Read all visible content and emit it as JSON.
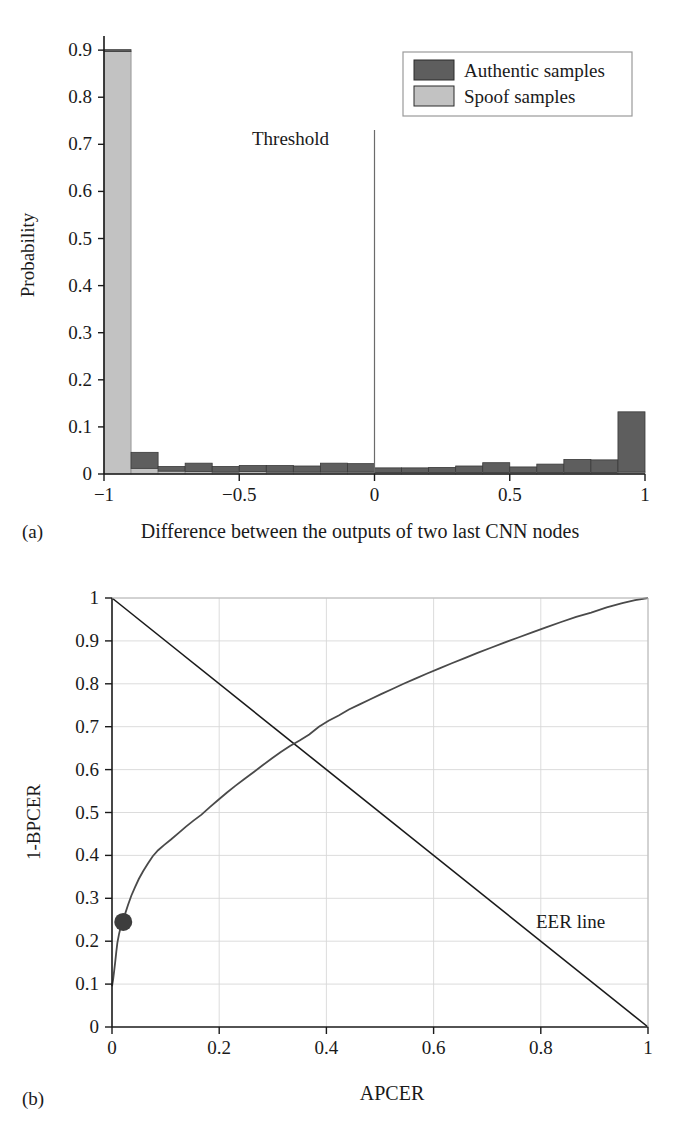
{
  "figure": {
    "panels": [
      {
        "id": "a",
        "subcaption": "(a)",
        "caption": "Difference between the outputs of two last CNN nodes"
      },
      {
        "id": "b",
        "subcaption": "(b)",
        "caption": "APCER"
      }
    ]
  },
  "colors": {
    "authentic": "#5e5e5e",
    "spoof": "#c2c2c2",
    "axis": "#1a1a1a",
    "grid": "#d8d8d8",
    "curve": "#4a4a4a",
    "eer_line": "#1a1a1a",
    "marker": "#3d3d3d",
    "background": "#ffffff"
  },
  "chart_data": [
    {
      "type": "bar",
      "panel": "a",
      "title": "",
      "xlabel": "Difference between the outputs of two last CNN nodes",
      "ylabel": "Probability",
      "xlim": [
        -1,
        1
      ],
      "ylim": [
        0,
        0.93
      ],
      "grid": false,
      "xticks": [
        -1,
        -0.5,
        0,
        0.5,
        1
      ],
      "xtick_labels": [
        "−1",
        "−0.5",
        "0",
        "0.5",
        "1"
      ],
      "yticks": [
        0,
        0.1,
        0.2,
        0.3,
        0.4,
        0.5,
        0.6,
        0.7,
        0.8,
        0.9
      ],
      "ytick_labels": [
        "0",
        "0.1",
        "0.2",
        "0.3",
        "0.4",
        "0.5",
        "0.6",
        "0.7",
        "0.8",
        "0.9"
      ],
      "bin_edges": [
        -1.0,
        -0.9,
        -0.8,
        -0.7,
        -0.6,
        -0.5,
        -0.4,
        -0.3,
        -0.2,
        -0.1,
        0.0,
        0.1,
        0.2,
        0.3,
        0.4,
        0.5,
        0.6,
        0.7,
        0.8,
        0.9,
        1.0
      ],
      "series": [
        {
          "name": "Spoof samples",
          "color": "#c2c2c2",
          "values": [
            0.897,
            0.012,
            0.006,
            0.005,
            0.004,
            0.005,
            0.004,
            0.004,
            0.004,
            0.004,
            0.003,
            0.003,
            0.003,
            0.003,
            0.003,
            0.003,
            0.003,
            0.003,
            0.003,
            0.004
          ]
        },
        {
          "name": "Authentic samples",
          "color": "#5e5e5e",
          "values": [
            0.004,
            0.034,
            0.01,
            0.018,
            0.012,
            0.013,
            0.014,
            0.013,
            0.019,
            0.018,
            0.01,
            0.01,
            0.011,
            0.014,
            0.021,
            0.012,
            0.018,
            0.028,
            0.027,
            0.128
          ]
        }
      ],
      "annotations": [
        {
          "name": "threshold",
          "label": "Threshold",
          "x": 0.0,
          "type": "vline"
        }
      ],
      "legend": {
        "position": "upper right",
        "entries": [
          {
            "label": "Authentic samples",
            "color": "#5e5e5e"
          },
          {
            "label": "Spoof samples",
            "color": "#c2c2c2"
          }
        ]
      }
    },
    {
      "type": "line",
      "panel": "b",
      "title": "",
      "xlabel": "APCER",
      "ylabel": "1-BPCER",
      "xlim": [
        0,
        1
      ],
      "ylim": [
        0,
        1
      ],
      "grid": true,
      "xticks": [
        0,
        0.2,
        0.4,
        0.6,
        0.8,
        1
      ],
      "xtick_labels": [
        "0",
        "0.2",
        "0.4",
        "0.6",
        "0.8",
        "1"
      ],
      "yticks": [
        0,
        0.1,
        0.2,
        0.3,
        0.4,
        0.5,
        0.6,
        0.7,
        0.8,
        0.9,
        1
      ],
      "ytick_labels": [
        "0",
        "0.1",
        "0.2",
        "0.3",
        "0.4",
        "0.5",
        "0.6",
        "0.7",
        "0.8",
        "0.9",
        "1"
      ],
      "series": [
        {
          "name": "ROC curve",
          "color": "#4a4a4a",
          "x": [
            0.0,
            0.002,
            0.004,
            0.006,
            0.008,
            0.01,
            0.013,
            0.016,
            0.02,
            0.024,
            0.03,
            0.036,
            0.043,
            0.05,
            0.058,
            0.067,
            0.076,
            0.086,
            0.097,
            0.11,
            0.124,
            0.138,
            0.152,
            0.167,
            0.182,
            0.198,
            0.214,
            0.23,
            0.247,
            0.264,
            0.281,
            0.298,
            0.315,
            0.332,
            0.35,
            0.368,
            0.386,
            0.404,
            0.423,
            0.442,
            0.462,
            0.482,
            0.502,
            0.523,
            0.544,
            0.566,
            0.588,
            0.611,
            0.634,
            0.658,
            0.682,
            0.707,
            0.732,
            0.758,
            0.784,
            0.811,
            0.838,
            0.866,
            0.894,
            0.923,
            0.952,
            0.976,
            1.0
          ],
          "y": [
            0.095,
            0.11,
            0.13,
            0.152,
            0.175,
            0.196,
            0.216,
            0.232,
            0.245,
            0.262,
            0.285,
            0.306,
            0.326,
            0.345,
            0.363,
            0.381,
            0.398,
            0.412,
            0.424,
            0.437,
            0.452,
            0.467,
            0.481,
            0.495,
            0.512,
            0.529,
            0.546,
            0.562,
            0.578,
            0.594,
            0.61,
            0.626,
            0.641,
            0.655,
            0.668,
            0.682,
            0.7,
            0.714,
            0.726,
            0.74,
            0.752,
            0.764,
            0.776,
            0.788,
            0.8,
            0.812,
            0.824,
            0.836,
            0.848,
            0.86,
            0.872,
            0.884,
            0.896,
            0.908,
            0.92,
            0.932,
            0.944,
            0.956,
            0.966,
            0.978,
            0.988,
            0.995,
            1.0
          ]
        },
        {
          "name": "EER line",
          "color": "#1a1a1a",
          "x": [
            0,
            1
          ],
          "y": [
            1,
            0
          ]
        }
      ],
      "markers": [
        {
          "name": "operating-point",
          "x": 0.021,
          "y": 0.245,
          "color": "#3d3d3d",
          "radius": 9
        }
      ],
      "annotations": [
        {
          "name": "eer-line-label",
          "label": "EER line",
          "x": 0.8,
          "y": 0.245
        }
      ]
    }
  ]
}
